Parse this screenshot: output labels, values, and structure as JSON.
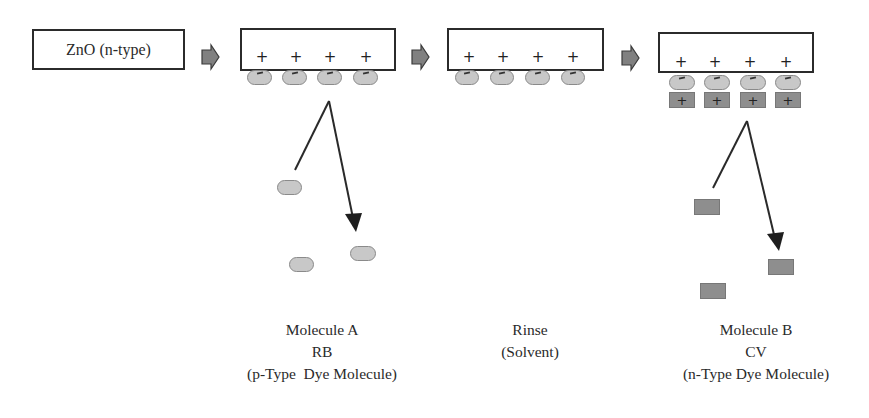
{
  "diagram": {
    "type": "process-flow",
    "steps": [
      {
        "id": "substrate",
        "label": "ZnO (n-type)"
      },
      {
        "id": "molecule-a-adsorbed",
        "surface_charges": [
          "+",
          "+",
          "+",
          "+"
        ],
        "adsorbed": [
          "-",
          "-",
          "-",
          "-"
        ]
      },
      {
        "id": "rinsed",
        "surface_charges": [
          "+",
          "+",
          "+",
          "+"
        ],
        "adsorbed": [
          "-",
          "-",
          "-",
          "-"
        ]
      },
      {
        "id": "molecule-b-adsorbed",
        "surface_charges": [
          "+",
          "+",
          "+",
          "+"
        ],
        "adsorbed": [
          "-",
          "-",
          "-",
          "-"
        ],
        "second_layer": [
          "+",
          "+",
          "+",
          "+"
        ]
      }
    ],
    "flow_arrow_icon": "block-right-arrow",
    "labels": {
      "molecule_a": {
        "line1": "Molecule A",
        "line2": "RB",
        "line3": "(p-Type  Dye Molecule)"
      },
      "rinse": {
        "line1": "Rinse",
        "line2": "(Solvent)"
      },
      "molecule_b": {
        "line1": "Molecule B",
        "line2": "CV",
        "line3": "(n-Type Dye Molecule)"
      }
    },
    "symbols": {
      "plus": "+",
      "minus": "−"
    },
    "colors": {
      "outline": "#2b2b2b",
      "molecule_a_fill": "#c8c8c8",
      "molecule_b_fill": "#8e8e8e",
      "arrow_fill": "#808080"
    }
  }
}
